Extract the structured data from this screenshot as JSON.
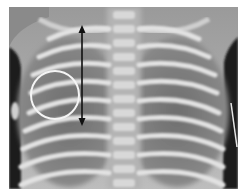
{
  "image": {
    "subject": "chest-radiograph",
    "view": "frontal",
    "border_color": "#ffffff",
    "frame": {
      "x": 9,
      "y": 7,
      "width": 229,
      "height": 182
    }
  },
  "annotations": {
    "double_arrow": {
      "color": "#111111",
      "x": 82,
      "y1": 25,
      "y2": 126
    },
    "circle": {
      "color": "#f4f4f4",
      "cx": 55,
      "cy": 95,
      "r": 24,
      "stroke_width": 2
    }
  },
  "palette": {
    "soft_tissue_dark": "#1c1c1c",
    "lung_field": "#7d7d7d",
    "bone": "#e2e2e2",
    "spine": "#d6d6d6"
  }
}
